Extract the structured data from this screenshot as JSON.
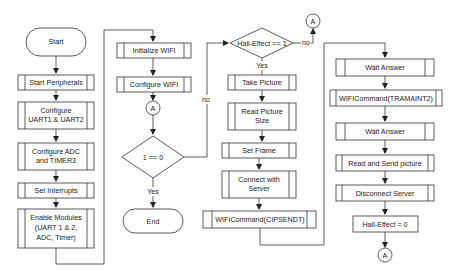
{
  "diagram": {
    "type": "flowchart",
    "nodes": {
      "start": "Start",
      "start_peripherals": "Start Peripherals",
      "configure_uart_l1": "Configure",
      "configure_uart_l2": "UART1 & UART2",
      "configure_adc_l1": "Configure ADC",
      "configure_adc_l2": "and TIMER3",
      "set_interrupts": "Set Interrupts",
      "enable_modules_l1": "Enable Modules",
      "enable_modules_l2": "(UART 1 & 2,",
      "enable_modules_l3": "ADC, Timer)",
      "initialize_wifi": "Initialize WIFI",
      "configure_wifi": "Configure WIFI",
      "connector_a1": "A",
      "decision_loop": "1 == 0",
      "end": "End",
      "decision_hall": "Hall-Effect == 1",
      "take_picture": "Take Picture",
      "read_picture_size_l1": "Read Picture",
      "read_picture_size_l2": "Size",
      "set_frame": "Set Frame",
      "connect_server_l1": "Connect with",
      "connect_server_l2": "Server",
      "wifi_cipsendt": "WIFICommand(CIPSENDT)",
      "connector_a2": "A",
      "wait_answer_1": "Wait Answer",
      "wifi_tramaint2": "WIFICommand(TRAMAINT2)",
      "wait_answer_2": "Wait Answer",
      "read_send_picture": "Read and Send picture",
      "disconnect_server": "Disconnect Server",
      "hall_reset": "Hall-Effect = 0",
      "connector_a3": "A"
    },
    "edge_labels": {
      "loop_yes": "Yes",
      "loop_no": "no",
      "hall_yes": "Yes",
      "hall_no": "no"
    }
  }
}
